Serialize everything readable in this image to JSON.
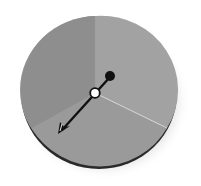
{
  "figure": {
    "type": "spinner",
    "sectors": [
      {
        "name": "upper-left",
        "color": "#8f8f8f",
        "start_deg": -90,
        "end_deg": 150
      },
      {
        "name": "right",
        "color": "#a3a3a3",
        "start_deg": -90,
        "end_deg": 30
      },
      {
        "name": "bottom",
        "color": "#999999",
        "start_deg": 30,
        "end_deg": 150
      }
    ],
    "pointer": {
      "direction": "lower-left",
      "color": "#111111"
    },
    "hub_color": "#ffffff",
    "knob_color": "#111111",
    "rim_color": "#2a2a2a"
  }
}
